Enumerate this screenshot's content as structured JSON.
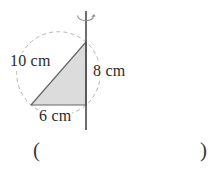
{
  "diagram": {
    "side_labels": {
      "hypotenuse": "10 cm",
      "vertical": "8 cm",
      "base": "6 cm"
    },
    "icons": {
      "rotation_arrow": "↻"
    },
    "colors": {
      "triangle_fill": "#dcdcdc",
      "triangle_outline": "#666666",
      "axis_line": "#4a4a4a",
      "dashed_circle": "#b5b5b5",
      "rotation_arrow": "#8d8d8d",
      "text": "#2b2b2b"
    }
  },
  "answer": {
    "open_paren": "(",
    "close_paren": ")"
  }
}
